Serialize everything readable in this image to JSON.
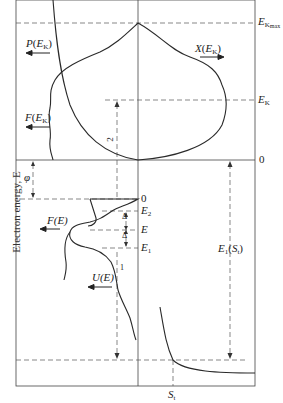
{
  "diagram": {
    "y_axis_label": "Electron energy, E",
    "labels": {
      "ek_max": {
        "main": "E",
        "sub": "K",
        "subsub": "max"
      },
      "ek": {
        "main": "E",
        "sub": "K"
      },
      "zero_upper": "0",
      "zero_lower": "0",
      "e2": {
        "main": "E",
        "sub": "2"
      },
      "e": "E",
      "e1": {
        "main": "E",
        "sub": "1"
      },
      "p_ek": {
        "fn": "P",
        "arg": "E",
        "sub": "K"
      },
      "x_ek": {
        "fn": "X",
        "arg": "E",
        "sub": "K"
      },
      "f_ek": {
        "fn": "F",
        "arg": "E",
        "sub": "K"
      },
      "f_e": "F(E)",
      "u_e": "U(E)",
      "phi": "φ",
      "delta_upper": "Δ",
      "delta_lower": "Δ",
      "arrow_2": "2",
      "arrow_1": "1",
      "e1_st": {
        "main": "E",
        "sub": "1",
        "arg": "S",
        "argsub": "t"
      },
      "st": {
        "main": "S",
        "sub": "t"
      }
    },
    "colors": {
      "line": "#2a2a2a",
      "dash": "#555555",
      "background": "#ffffff"
    }
  }
}
